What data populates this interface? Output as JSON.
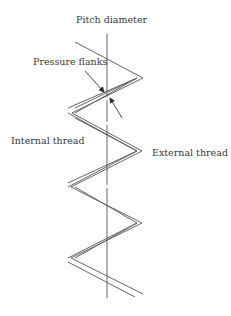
{
  "figure": {
    "type": "thread-diagram",
    "labels": {
      "pitch_diameter": "Pitch diameter",
      "pressure_flanks": "Pressure flanks",
      "internal_thread": "Internal thread",
      "external_thread": "External thread"
    },
    "colors": {
      "line": "#555555",
      "text": "#3a3a3a",
      "background": "#ffffff"
    }
  }
}
